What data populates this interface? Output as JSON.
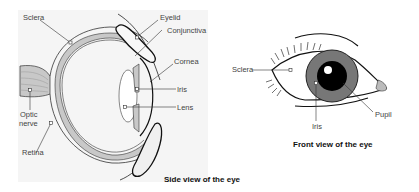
{
  "side_view": {
    "caption": "Side view of the eye",
    "labels": {
      "sclera": "Sclera",
      "optic_nerve_1": "Optic",
      "optic_nerve_2": "nerve",
      "retina": "Retina",
      "eyelid": "Eyelid",
      "conjunctiva": "Conjunctiva",
      "cornea": "Cornea",
      "iris": "Iris",
      "lens": "Lens"
    }
  },
  "front_view": {
    "caption": "Front view of the eye",
    "labels": {
      "sclera": "Sclera",
      "iris": "Iris",
      "pupil": "Pupil"
    }
  },
  "colors": {
    "background": "#ffffff",
    "panel": "#f4f4f4",
    "tissue_grey": "#c8c8c8",
    "iris_grey": "#777777",
    "pupil": "#000000",
    "line": "#111111"
  }
}
